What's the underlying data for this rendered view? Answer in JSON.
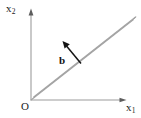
{
  "figure": {
    "background_color": "#ffffff",
    "width": 141,
    "height": 118,
    "axes": {
      "origin_label": "O",
      "horizontal": {
        "label_main": "x",
        "label_sub": "1",
        "name": "x1-axis",
        "color": "#b5b5b5",
        "start": [
          31,
          100
        ],
        "end": [
          126,
          100
        ],
        "arrow": true
      },
      "vertical": {
        "label_main": "x",
        "label_sub": "2",
        "name": "x2-axis",
        "color": "#b5b5b5",
        "start": [
          31,
          100
        ],
        "end": [
          31,
          10
        ],
        "arrow": true
      }
    },
    "plane_line": {
      "name": "inclined-double-line",
      "description": "double parallel line through origin rising to upper right",
      "color": "#9a9a9a",
      "from": [
        31,
        100
      ],
      "to": [
        133,
        20
      ],
      "offset_px": 3,
      "angle_deg": 38
    },
    "normal_vector": {
      "label": "b",
      "bold": true,
      "color": "#111111",
      "tail": [
        81,
        63
      ],
      "tip": [
        63,
        42
      ],
      "arrowhead": "solid-triangle"
    }
  }
}
